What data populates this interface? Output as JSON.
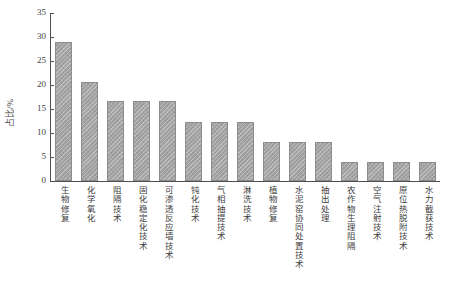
{
  "chart_data": {
    "type": "bar",
    "title": "",
    "xlabel": "",
    "ylabel": "占比/%",
    "ylim": [
      0,
      35
    ],
    "yticks": [
      0,
      5,
      10,
      15,
      20,
      25,
      30,
      35
    ],
    "ytick_labels": [
      "0",
      "5",
      "10",
      "15",
      "20",
      "25",
      "30",
      "35"
    ],
    "grid": false,
    "legend": false,
    "bar_color": "#a3a3a3",
    "bar_edge_color": "#8c8c8c",
    "axis_color": "#4f4f4f",
    "categories": [
      "生物修复",
      "化学氧化",
      "阻隔技术",
      "固化稳定化技术",
      "可渗透反应墙技术",
      "钝化技术",
      "气相抽提技术",
      "淋洗技术",
      "植物修复",
      "水泥窑协同处置技术",
      "抽出处理",
      "农作物生理阻隔",
      "空气注射技术",
      "原位热脱附技术",
      "水力截获技术"
    ],
    "values": [
      29.0,
      20.7,
      16.6,
      16.6,
      16.6,
      12.3,
      12.3,
      12.3,
      8.1,
      8.1,
      8.1,
      3.9,
      3.9,
      3.9,
      3.9
    ]
  }
}
